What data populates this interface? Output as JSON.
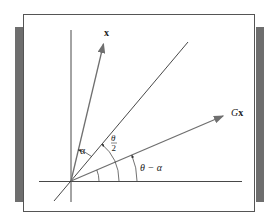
{
  "figure": {
    "labels": {
      "vector_x": "x",
      "vector_gx_prefix": "G",
      "vector_gx_bold": "x",
      "angle_alpha": "α",
      "angle_theta_half_num": "θ",
      "angle_theta_half_den": "2",
      "angle_theta_minus_alpha": "θ − α"
    },
    "angles_deg": {
      "x_vector": 76.5,
      "mirror_line": 50,
      "gx_vector": 23
    },
    "colors": {
      "vector": "#6f6f6f",
      "axis": "#333333",
      "side_bar": "#6e6e6e"
    }
  }
}
